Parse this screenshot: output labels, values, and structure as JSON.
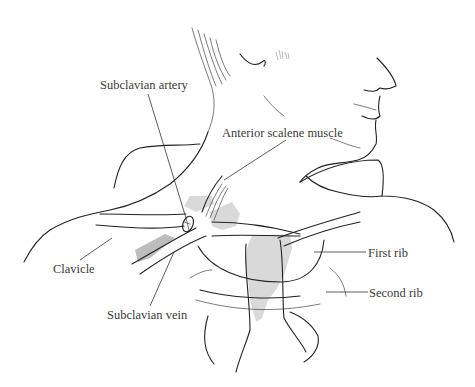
{
  "figure": {
    "colors": {
      "ink": "#222222",
      "label_text": "#3a3a3a",
      "shading": "#d9d9d9",
      "background": "#ffffff"
    }
  },
  "labels": {
    "subclavian_artery": "Subclavian artery",
    "anterior_scalene_muscle": "Anterior scalene muscle",
    "clavicle": "Clavicle",
    "first_rib": "First rib",
    "second_rib": "Second rib",
    "subclavian_vein": "Subclavian vein"
  }
}
